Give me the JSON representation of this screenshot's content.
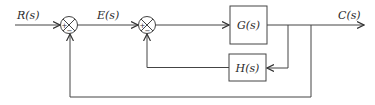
{
  "diagram": {
    "type": "control-system-block-diagram",
    "signals": {
      "input": "R(s)",
      "error": "E(s)",
      "output": "C(s)"
    },
    "blocks": {
      "forward": "G(s)",
      "feedback": "H(s)"
    },
    "summing_junctions": [
      {
        "id": "sum1",
        "plus": "+",
        "minus": "−"
      },
      {
        "id": "sum2",
        "plus": "+",
        "minus": "−"
      }
    ],
    "colors": {
      "line": "#444444",
      "text": "#2a2a2a",
      "background": "#ffffff"
    }
  }
}
